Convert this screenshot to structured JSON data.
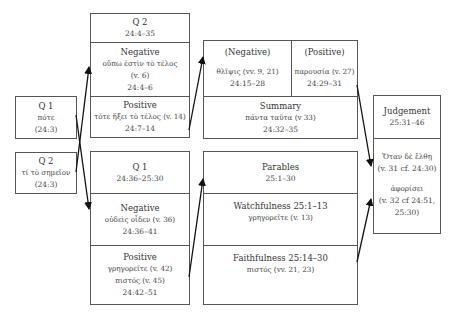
{
  "left": {
    "q1": {
      "title": "Q 1",
      "greek": "πότε",
      "ref": "(24:3)"
    },
    "q2": {
      "title": "Q 2",
      "greek": "τί τὸ σημεῖον",
      "ref": "(24:3)"
    }
  },
  "middle_top": {
    "header": {
      "title": "Q 2",
      "ref": "24:4–35"
    },
    "negative": {
      "title": "Negative",
      "greek": "οὔπω ἐστὶν τὸ τέλος",
      "verse": "(v. 6)",
      "ref": "24:4–6"
    },
    "positive": {
      "title": "Positive",
      "greek": "τότε ἥξει τὸ τέλος (v. 14)",
      "ref": "24:7–14"
    }
  },
  "middle_bottom": {
    "header": {
      "title": "Q 1",
      "ref": "24:36–25:30"
    },
    "negative": {
      "title": "Negative",
      "greek": "οὐδεὶς οἶδεν (v. 36)",
      "ref": "24:36–41"
    },
    "positive": {
      "title": "Positive",
      "greek": "γρηγορεῖτε (v. 42)",
      "greek2": "πιστός (v. 45)",
      "ref": "24:42–51"
    }
  },
  "right_top": {
    "negative": {
      "title": "(Negative)",
      "greek": "θλῖψις (vv. 9, 21)",
      "ref": "24:15–28"
    },
    "positive": {
      "title": "(Positive)",
      "greek": "παρουσία (v. 27)",
      "ref": "24:29–31"
    },
    "summary": {
      "title": "Summary",
      "greek": "πάντα ταῦτα (v 33)",
      "ref": "24:32–35"
    }
  },
  "right_bottom": {
    "parables": {
      "title": "Parables",
      "ref": "25:1–30"
    },
    "watchfulness": {
      "title": "Watchfulness 25:1–13",
      "greek": "γρηγορεῖτε (v. 13)"
    },
    "faithfulness": {
      "title": "Faithfulness 25:14–30",
      "greek": "πιστός (vv. 21, 23)"
    }
  },
  "judgement": {
    "title": "Judgement",
    "ref": "25:31–46",
    "greek1": "Ὅταν δὲ ἔλθῃ",
    "ref1": "(v. 31 cf. 24:30)",
    "greek2": "ἀφορίσει",
    "ref2a": "(v. 32 cf 24:51,",
    "ref2b": "25:30)"
  }
}
